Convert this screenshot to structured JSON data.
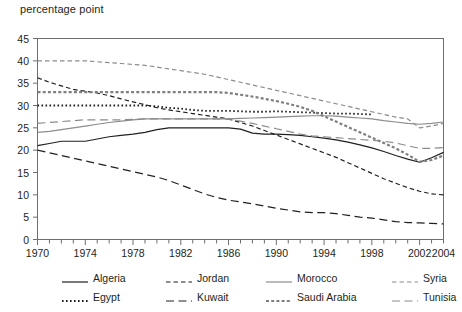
{
  "chart": {
    "type": "line",
    "title": "percentage point",
    "xlabel": "",
    "ylabel": "percentage point"
  },
  "axes": {
    "y_ticks": [
      "45",
      "40",
      "35",
      "30",
      "25",
      "20",
      "15",
      "10",
      "5",
      "0"
    ],
    "x_ticks": [
      "1970",
      "1974",
      "1978",
      "1982",
      "1986",
      "1990",
      "1994",
      "1998",
      "2002",
      "2004"
    ],
    "ylim": [
      0,
      45
    ],
    "xlim": [
      1970,
      2004
    ],
    "grid": "off"
  },
  "legend": {
    "position": "bottom",
    "rows": [
      [
        {
          "label": "Algeria",
          "swatch": "solid-black"
        },
        {
          "label": "Jordan",
          "swatch": "dashed-black-short"
        },
        {
          "label": "Morocco",
          "swatch": "solid-gray"
        },
        {
          "label": "Syria",
          "swatch": "dashed-gray-short"
        }
      ],
      [
        {
          "label": "Egypt",
          "swatch": "dotted-black"
        },
        {
          "label": "Kuwait",
          "swatch": "dashed-black-long"
        },
        {
          "label": "Saudi Arabia",
          "swatch": "dotted-gray-thick"
        },
        {
          "label": "Tunisia",
          "swatch": "dashed-gray-long"
        }
      ]
    ]
  },
  "chart_data": {
    "type": "line",
    "title": "percentage point",
    "xlabel": "",
    "ylabel": "percentage point",
    "xlim": [
      1970,
      2004
    ],
    "ylim": [
      0,
      45
    ],
    "grid": "off",
    "legend_position": "bottom",
    "x": [
      1970,
      1971,
      1972,
      1973,
      1974,
      1975,
      1976,
      1977,
      1978,
      1979,
      1980,
      1981,
      1982,
      1983,
      1984,
      1985,
      1986,
      1987,
      1988,
      1989,
      1990,
      1991,
      1992,
      1993,
      1994,
      1995,
      1996,
      1997,
      1998,
      1999,
      2000,
      2001,
      2002,
      2003,
      2004
    ],
    "series": [
      {
        "name": "Algeria",
        "style": "solid",
        "color": "#231f20",
        "values": [
          21.0,
          21.5,
          22.0,
          22.0,
          22.0,
          22.5,
          23.0,
          23.3,
          23.6,
          24.0,
          24.6,
          25.0,
          25.0,
          25.0,
          25.0,
          25.0,
          25.0,
          24.7,
          23.8,
          23.6,
          23.6,
          23.5,
          23.3,
          23.0,
          22.7,
          22.3,
          21.8,
          21.2,
          20.5,
          19.7,
          18.8,
          18.0,
          17.3,
          18.3,
          19.5
        ]
      },
      {
        "name": "Egypt",
        "style": "dotted",
        "color": "#231f20",
        "values": [
          30.0,
          30.0,
          30.0,
          30.0,
          30.0,
          30.0,
          30.0,
          30.0,
          30.0,
          30.0,
          29.8,
          29.5,
          29.3,
          29.0,
          28.8,
          28.8,
          28.8,
          28.7,
          28.6,
          28.6,
          28.7,
          28.6,
          28.5,
          28.4,
          28.3,
          28.2,
          28.2,
          28.1,
          28.0,
          null,
          null,
          null,
          null,
          null,
          null
        ]
      },
      {
        "name": "Jordan",
        "style": "dashed-short",
        "color": "#231f20",
        "values": [
          36.2,
          35.2,
          34.4,
          33.6,
          33.2,
          32.8,
          32.2,
          31.5,
          30.8,
          30.2,
          29.5,
          29.0,
          28.6,
          28.2,
          27.8,
          27.4,
          27.0,
          26.2,
          25.4,
          24.4,
          23.4,
          22.4,
          21.4,
          20.4,
          19.4,
          18.4,
          17.2,
          16.0,
          14.8,
          13.6,
          12.6,
          11.6,
          10.8,
          10.2,
          10.0
        ]
      },
      {
        "name": "Kuwait",
        "style": "dashed-long",
        "color": "#231f20",
        "values": [
          20.0,
          19.4,
          18.8,
          18.2,
          17.6,
          17.0,
          16.4,
          15.8,
          15.2,
          14.6,
          14.0,
          13.2,
          12.2,
          11.2,
          10.2,
          9.4,
          8.8,
          8.4,
          8.0,
          7.5,
          7.0,
          6.6,
          6.2,
          6.0,
          6.0,
          5.8,
          5.4,
          5.0,
          4.8,
          4.4,
          4.0,
          3.8,
          3.7,
          3.6,
          3.5
        ]
      },
      {
        "name": "Morocco",
        "style": "solid",
        "color": "#8c8c8c",
        "values": [
          24.0,
          24.2,
          24.6,
          25.0,
          25.4,
          25.8,
          26.2,
          26.5,
          26.8,
          27.0,
          27.0,
          27.0,
          27.0,
          27.0,
          27.0,
          27.0,
          27.0,
          27.1,
          27.2,
          27.3,
          27.4,
          27.5,
          27.6,
          27.7,
          27.7,
          27.6,
          27.4,
          27.2,
          27.0,
          26.6,
          26.3,
          26.0,
          25.8,
          26.0,
          26.3
        ]
      },
      {
        "name": "Saudi Arabia",
        "style": "dotted-thick",
        "color": "#7f7f7f",
        "values": [
          33.0,
          33.0,
          33.0,
          33.0,
          33.0,
          33.0,
          33.0,
          33.0,
          33.0,
          33.0,
          33.0,
          33.0,
          33.0,
          33.0,
          33.0,
          33.0,
          32.8,
          32.4,
          32.0,
          31.5,
          31.0,
          30.4,
          29.7,
          28.8,
          27.6,
          26.4,
          25.2,
          24.0,
          22.8,
          21.6,
          20.4,
          19.0,
          17.4,
          17.8,
          18.8
        ]
      },
      {
        "name": "Syria",
        "style": "dashed-short",
        "color": "#8c8c8c",
        "values": [
          40.0,
          40.0,
          40.0,
          40.0,
          40.0,
          39.8,
          39.6,
          39.4,
          39.2,
          39.0,
          38.6,
          38.2,
          37.8,
          37.4,
          37.0,
          36.4,
          35.8,
          35.2,
          34.6,
          34.0,
          33.4,
          32.8,
          32.2,
          31.6,
          31.0,
          30.4,
          29.8,
          29.2,
          28.6,
          28.0,
          27.4,
          27.0,
          25.0,
          25.4,
          26.0
        ]
      },
      {
        "name": "Tunisia",
        "style": "dashed-long",
        "color": "#8c8c8c",
        "values": [
          26.0,
          26.2,
          26.4,
          26.6,
          26.8,
          26.8,
          26.8,
          26.8,
          26.9,
          27.0,
          27.0,
          27.0,
          27.0,
          27.0,
          27.0,
          27.0,
          26.9,
          26.5,
          26.0,
          25.4,
          24.8,
          24.2,
          23.6,
          23.2,
          23.0,
          22.8,
          22.6,
          22.4,
          22.2,
          22.0,
          21.6,
          21.0,
          20.4,
          20.4,
          20.6
        ]
      }
    ]
  }
}
